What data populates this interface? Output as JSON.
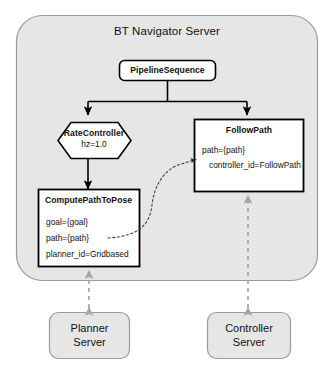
{
  "diagram": {
    "title": "BT Navigator Server",
    "type": "behavior-tree-architecture",
    "colors": {
      "container_fill": "#e6e6e6",
      "container_stroke": "#999999",
      "node_fill": "#ffffff",
      "node_stroke": "#000000",
      "server_fill": "#e6e6e6",
      "server_stroke": "#9a9a9a",
      "edge_solid": "#000000",
      "edge_dashed_grey": "#a6a6a6",
      "edge_dashed_dark": "#444444",
      "text": "#111111"
    },
    "container": {
      "label": "BT Navigator Server",
      "name": "bt-navigator-server-container"
    },
    "nodes": [
      {
        "id": "pipeline-sequence",
        "shape": "rounded-rect",
        "title": "PipelineSequence",
        "lines": []
      },
      {
        "id": "rate-controller",
        "shape": "hexagon",
        "title": "RateController",
        "lines": [
          "hz=1.0"
        ]
      },
      {
        "id": "follow-path",
        "shape": "rect",
        "title": "FollowPath",
        "lines": [
          "path={path}",
          "controller_id=FollowPath"
        ]
      },
      {
        "id": "compute-path-to-pose",
        "shape": "rect",
        "title": "ComputePathToPose",
        "lines": [
          "goal={goal}",
          "path={path}",
          "planner_id=Gridbased"
        ]
      }
    ],
    "servers": [
      {
        "id": "planner-server",
        "line1": "Planner",
        "line2": "Server"
      },
      {
        "id": "controller-server",
        "line1": "Controller",
        "line2": "Server"
      }
    ],
    "edges": [
      {
        "id": "pipeline-to-rate-controller",
        "style": "solid",
        "arrow": "single"
      },
      {
        "id": "pipeline-to-follow-path",
        "style": "solid",
        "arrow": "single"
      },
      {
        "id": "rate-controller-to-compute-path",
        "style": "solid",
        "arrow": "single"
      },
      {
        "id": "compute-path-blackboard-to-follow-path",
        "style": "dashed",
        "arrow": "single"
      },
      {
        "id": "planner-server-to-compute-path",
        "style": "dashed",
        "arrow": "double"
      },
      {
        "id": "controller-server-to-follow-path",
        "style": "dashed",
        "arrow": "double"
      }
    ]
  }
}
